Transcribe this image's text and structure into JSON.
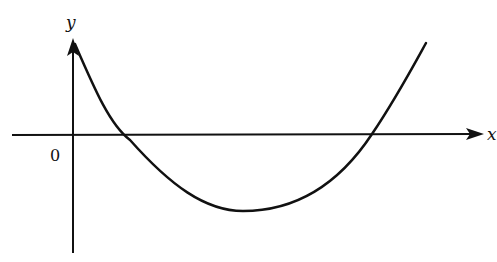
{
  "diagram": {
    "type": "function-graph",
    "axes": {
      "x_label": "x",
      "y_label": "y",
      "origin_label": "0"
    },
    "curve": {
      "shape": "upward-opening parabola",
      "description": "Curve starts high near the y-axis, crosses the x-axis twice (both positive x), reaches a minimum below the x-axis, then rises again"
    },
    "colors": {
      "stroke": "#111111",
      "background": "#ffffff"
    }
  }
}
